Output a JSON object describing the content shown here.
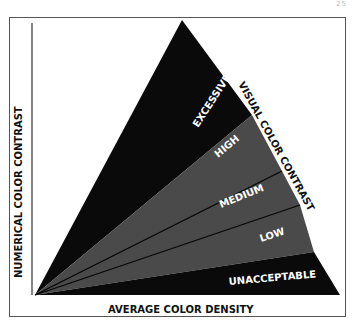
{
  "page": {
    "number": "25"
  },
  "diagram": {
    "y_axis_label": "NUMERICAL COLOR CONTRAST",
    "x_axis_label": "AVERAGE COLOR DENSITY",
    "hypotenuse_label": "VISUAL COLOR CONTRAST",
    "bands": [
      {
        "id": "excessive",
        "label": "EXCESSIVE",
        "fill": "#0a0a0a"
      },
      {
        "id": "high",
        "label": "HIGH",
        "fill": "#4a4a4a"
      },
      {
        "id": "medium",
        "label": "MEDIUM",
        "fill": "#4a4a4a"
      },
      {
        "id": "low",
        "label": "LOW",
        "fill": "#4a4a4a"
      },
      {
        "id": "unacceptable",
        "label": "UNACCEPTABLE",
        "fill": "#0a0a0a"
      }
    ],
    "colors": {
      "black": "#0a0a0a",
      "gray": "#4a4a4a",
      "frame": "#555555",
      "label_light": "#ffffff",
      "label_dark": "#111111"
    }
  }
}
